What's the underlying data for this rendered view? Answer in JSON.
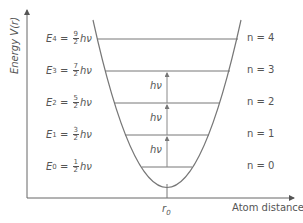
{
  "axes": {
    "y_label": "Energy V(r)",
    "x_label_text": "Atom distance ",
    "x_label_var": "r",
    "r0_label": "r",
    "r0_sub": "0"
  },
  "levels": [
    {
      "E_sym": "E",
      "E_sub": "4",
      "num": "9",
      "den": "2",
      "unit": "hν",
      "n_label": "n = 4"
    },
    {
      "E_sym": "E",
      "E_sub": "3",
      "num": "7",
      "den": "2",
      "unit": "hν",
      "n_label": "n = 3"
    },
    {
      "E_sym": "E",
      "E_sub": "2",
      "num": "5",
      "den": "2",
      "unit": "hν",
      "n_label": "n = 2"
    },
    {
      "E_sym": "E",
      "E_sub": "1",
      "num": "3",
      "den": "2",
      "unit": "hν",
      "n_label": "n = 1"
    },
    {
      "E_sym": "E",
      "E_sub": "0",
      "num": "1",
      "den": "2",
      "unit": "hν",
      "n_label": "n = 0"
    }
  ],
  "transitions": [
    {
      "label": "hν"
    },
    {
      "label": "hν"
    },
    {
      "label": "hν"
    }
  ],
  "colors": {
    "line": "#666666",
    "text": "#555555"
  }
}
